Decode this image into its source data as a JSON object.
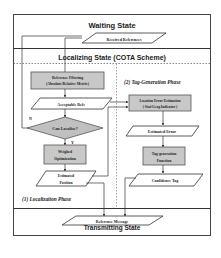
{
  "states": {
    "waiting": "Waiting State",
    "localizing": "Localizing State (COTA Scheme)",
    "transmitting": "Transmitting State"
  },
  "phases": {
    "localization": "(1) Localization Phase",
    "tag_generation": "(2) Tag-Generation Phase"
  },
  "nodes": {
    "received_references": "Received References",
    "reference_filtering_1": "Reference Filtering",
    "reference_filtering_2": "(Absolute/Relative Metric)",
    "acceptable_refs": "Acceptable Refs",
    "can_localize": "Can Localize?",
    "weighted_opt_1": "Weighed",
    "weighted_opt_2": "Optimization",
    "estimated_position_1": "Estimated",
    "estimated_position_2": "Position",
    "loc_error_est_1": "Location Error Estimation",
    "loc_error_est_2": "( Stat/Geog Indicator )",
    "estimated_error": "Estimated Error",
    "tag_gen_func_1": "Tag-generation",
    "tag_gen_func_2": "Function",
    "confidence_tag": "Confidence Tag",
    "reference_message": "Reference Message"
  },
  "edge_labels": {
    "no": "N",
    "yes": "Y"
  },
  "colors": {
    "process_fill": "#c8c8c8",
    "decision_fill": "#c0c0c0",
    "line": "#333333",
    "background": "#ffffff"
  }
}
